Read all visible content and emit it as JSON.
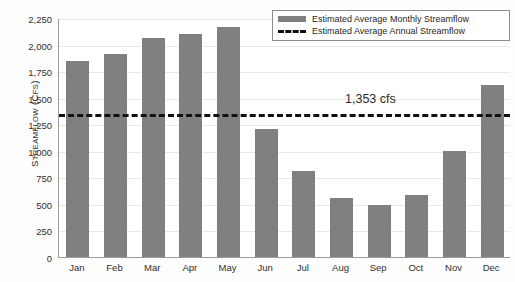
{
  "chart_data": {
    "type": "bar",
    "title": "",
    "xlabel": "",
    "ylabel": "STREAMFLOW (CFS)",
    "ylabel_main": "S",
    "ylabel_rest": "TREAMFLOW",
    "ylabel_unit_open": " (",
    "ylabel_unit_c": "C",
    "ylabel_unit_rest": "FS",
    "ylabel_unit_close": ")",
    "categories": [
      "Jan",
      "Feb",
      "Mar",
      "Apr",
      "May",
      "Jun",
      "Jul",
      "Aug",
      "Sep",
      "Oct",
      "Nov",
      "Dec"
    ],
    "values": [
      1850,
      1915,
      2065,
      2095,
      2170,
      1205,
      810,
      555,
      490,
      585,
      1000,
      1620
    ],
    "series": [
      {
        "name": "Estimated Average Monthly Streamflow",
        "values": [
          1850,
          1915,
          2065,
          2095,
          2170,
          1205,
          810,
          555,
          490,
          585,
          1000,
          1620
        ]
      }
    ],
    "ylim": [
      0,
      2250
    ],
    "y_ticks": [
      0,
      250,
      500,
      750,
      1000,
      1250,
      1500,
      1750,
      2000,
      2250
    ],
    "y_tick_labels": [
      "0",
      "250",
      "500",
      "750",
      "1,000",
      "1,250",
      "1,500",
      "1,750",
      "2,000",
      "2,250"
    ],
    "grid": true,
    "legend_position": "top-right",
    "annotations": [
      {
        "name": "annual-average-value",
        "text": "1,353 cfs",
        "value": 1353
      }
    ],
    "reference_line": {
      "name": "Estimated Average Annual Streamflow",
      "value": 1353,
      "style": "dashed",
      "color": "#111111"
    },
    "colors": {
      "bar": "#808080",
      "reference_line": "#111111",
      "gridline": "#e9e9e9",
      "axis": "#9a9a9a",
      "text": "#2f2f2f"
    }
  },
  "legend": {
    "items": [
      {
        "label": "Estimated Average Monthly Streamflow",
        "marker": "bar-swatch"
      },
      {
        "label": "Estimated Average Annual Streamflow",
        "marker": "dashed-line-swatch"
      }
    ]
  }
}
